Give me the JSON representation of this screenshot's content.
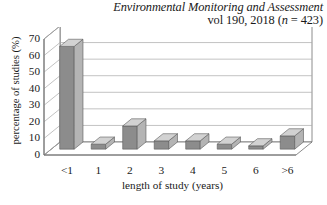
{
  "title": {
    "line1": "Environmental Monitoring and Assessment",
    "line2_prefix": "vol 190, 2018 (",
    "line2_italic": "n",
    "line2_suffix": " = 423)"
  },
  "chart_data": {
    "type": "bar",
    "title": "Environmental Monitoring and Assessment vol 190, 2018 (n = 423)",
    "xlabel": "length of study (years)",
    "ylabel": "percentage of studies (%)",
    "categories": [
      "<1",
      "1",
      "2",
      "3",
      "4",
      "5",
      "6",
      ">6"
    ],
    "values": [
      62,
      3,
      14,
      5,
      5,
      3,
      2,
      8
    ],
    "ylim": [
      0,
      70
    ],
    "ytick_labels": [
      "0",
      "10",
      "20",
      "30",
      "40",
      "50",
      "60",
      "70"
    ],
    "ytick_values": [
      0,
      10,
      20,
      30,
      40,
      50,
      60,
      70
    ],
    "grid": true,
    "legend": "none",
    "style": "3d-column",
    "colors": {
      "bar_front": "#8c8c8c",
      "bar_side": "#b4b4b4",
      "bar_top": "#d2d2d2",
      "bar_edge": "#5a5a5a",
      "grid": "#a8a8a8",
      "axis": "#6e6e6e",
      "background": "#ffffff",
      "text": "#1a1a1a"
    }
  }
}
